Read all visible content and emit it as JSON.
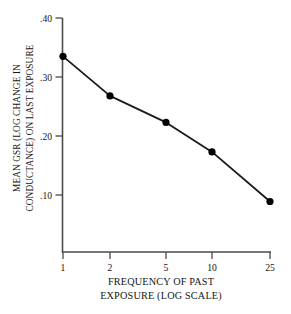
{
  "chart_data": {
    "type": "line",
    "title": "",
    "subtitle": "",
    "xlabel": "FREQUENCY OF PAST EXPOSURE (LOG SCALE)",
    "xlabel_lines": [
      "FREQUENCY OF PAST",
      "EXPOSURE (LOG SCALE)"
    ],
    "ylabel": "MEAN GSR (LOG CHANGE IN CONDUCTANCE) ON LAST EXPOSURE",
    "ylabel_lines": [
      "MEAN GSR (LOG CHANGE IN",
      "CONDUCTANCE) ON LAST EXPOSURE"
    ],
    "x": [
      1,
      2,
      5,
      10,
      25
    ],
    "categories": [
      "1",
      "2",
      "5",
      "10",
      "25"
    ],
    "values": [
      0.335,
      0.268,
      0.223,
      0.173,
      0.089
    ],
    "xticklabels": [
      "1",
      "2",
      "5",
      "10",
      "25"
    ],
    "yticklabels": [
      ".40",
      ".30",
      ".20",
      ".10"
    ],
    "ytickvalues": [
      0.4,
      0.3,
      0.2,
      0.1
    ],
    "ylim": [
      0.0,
      0.4
    ],
    "xscale": "log",
    "grid": false,
    "legend": null,
    "marker": "filled-circle",
    "line_color": "#1a1a1a",
    "marker_color": "#000000",
    "axis_color": "#4a4a4a",
    "background": "#ffffff"
  },
  "axes": {
    "y_tick_marks": 4,
    "x_tick_marks": 5
  }
}
